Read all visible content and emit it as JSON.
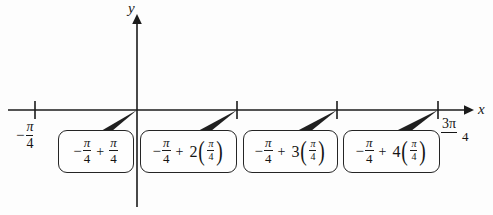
{
  "figure": {
    "background_color": "#fdfdfd",
    "ink_color": "#1a1a1a"
  },
  "axes": {
    "x_label": "x",
    "y_label": "y",
    "x_axis_y": 110,
    "y_axis_x": 137
  },
  "tick_labels": {
    "left": {
      "sign": "−",
      "numerator": "π",
      "denominator": "4",
      "text": "−π/4"
    },
    "right": {
      "numerator": "3π",
      "denominator": "4",
      "text": "3π/4"
    }
  },
  "ticks": [
    {
      "name": "tick-neg-pi-4",
      "x": 35
    },
    {
      "name": "tick-origin",
      "x": 137
    },
    {
      "name": "tick-pi-4",
      "x": 237
    },
    {
      "name": "tick-pi-2",
      "x": 337
    },
    {
      "name": "tick-3pi-4",
      "x": 438
    }
  ],
  "callouts": [
    {
      "id": "callout-1",
      "target_tick_x": 137,
      "minus": "−",
      "first_num": "π",
      "first_den": "4",
      "plus": "+",
      "coefficient": "",
      "second_num": "π",
      "second_den": "4",
      "paren_open": "",
      "paren_close": "",
      "text": "−π/4 + π/4"
    },
    {
      "id": "callout-2",
      "target_tick_x": 237,
      "minus": "−",
      "first_num": "π",
      "first_den": "4",
      "plus": "+",
      "coefficient": "2",
      "second_num": "π",
      "second_den": "4",
      "paren_open": "(",
      "paren_close": ")",
      "text": "−π/4 + 2(π/4)"
    },
    {
      "id": "callout-3",
      "target_tick_x": 337,
      "minus": "−",
      "first_num": "π",
      "first_den": "4",
      "plus": "+",
      "coefficient": "3",
      "second_num": "π",
      "second_den": "4",
      "paren_open": "(",
      "paren_close": ")",
      "text": "−π/4 + 3(π/4)"
    },
    {
      "id": "callout-4",
      "target_tick_x": 438,
      "minus": "−",
      "first_num": "π",
      "first_den": "4",
      "plus": "+",
      "coefficient": "4",
      "second_num": "π",
      "second_den": "4",
      "paren_open": "(",
      "paren_close": ")",
      "text": "−π/4 + 4(π/4)"
    }
  ]
}
